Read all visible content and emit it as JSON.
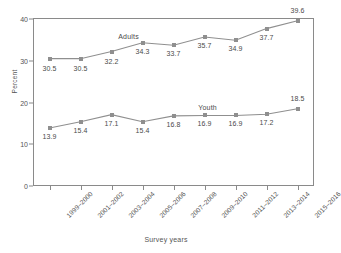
{
  "chart_data": {
    "type": "line",
    "title": "",
    "xlabel": "Survey years",
    "ylabel": "Percent",
    "categories": [
      "1999–2000",
      "2001–2002",
      "2003–2004",
      "2005–2006",
      "2007–2008",
      "2009–2010",
      "2011–2012",
      "2013–2014",
      "2015–2016"
    ],
    "yticks": [
      "0",
      "10",
      "20",
      "30",
      "40"
    ],
    "ylim": [
      0,
      40
    ],
    "grid": false,
    "legend": "inline-series-labels",
    "series": [
      {
        "name": "Adults",
        "color": "#8f8f8f",
        "values": [
          30.5,
          30.5,
          32.2,
          34.3,
          33.7,
          35.7,
          34.9,
          37.7,
          39.6
        ],
        "labels": [
          "30.5",
          "30.5",
          "32.2",
          "34.3",
          "33.7",
          "35.7",
          "34.9",
          "37.7",
          "39.6"
        ]
      },
      {
        "name": "Youth",
        "color": "#8f8f8f",
        "values": [
          13.9,
          15.4,
          17.1,
          15.4,
          16.8,
          16.9,
          16.9,
          17.2,
          18.5
        ],
        "labels": [
          "13.9",
          "15.4",
          "17.1",
          "15.4",
          "16.8",
          "16.9",
          "16.9",
          "17.2",
          "18.5"
        ]
      }
    ]
  },
  "style": {
    "line_color": "#8f8f8f",
    "axis_color": "#8a8a8a",
    "text_color": "#555555",
    "background": "#ffffff"
  }
}
